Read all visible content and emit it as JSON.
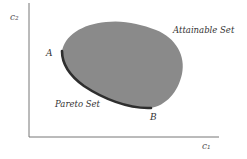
{
  "diagram": {
    "title": "",
    "axes": {
      "y_label": "c₂",
      "x_label": "c₁"
    },
    "regions": {
      "attainable_label": "Attainable Set",
      "attainable_fill": "#8a8a8a",
      "pareto_label": "Pareto Set",
      "pareto_color": "#2e2e2e"
    },
    "points": {
      "a_label": "A",
      "b_label": "B"
    },
    "colors": {
      "axis": "#777777",
      "background": "#ffffff"
    }
  }
}
